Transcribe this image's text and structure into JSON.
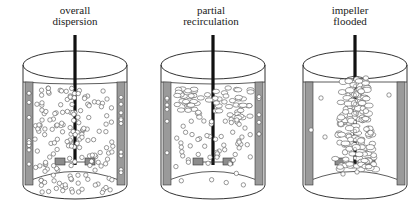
{
  "figure": {
    "colors": {
      "outline": "#333333",
      "baffle": "#9a9a9a",
      "shaft": "#111111",
      "bubble_fill": "#ffffff",
      "impeller": "#8c8c8c"
    },
    "panels": [
      {
        "id": "overall",
        "label_line1": "overall",
        "label_line2": "dispersion",
        "regime": "overall dispersion"
      },
      {
        "id": "partial",
        "label_line1": "partial",
        "label_line2": "recirculation",
        "regime": "partial recirculation"
      },
      {
        "id": "flooded",
        "label_line1": "impeller",
        "label_line2": "flooded",
        "regime": "impeller flooded"
      }
    ]
  }
}
